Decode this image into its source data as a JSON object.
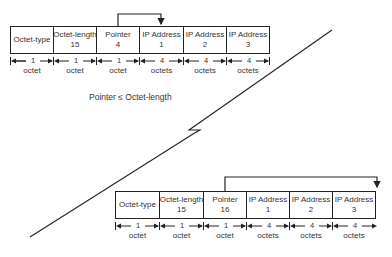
{
  "caption": "Pointer ≤ Octet-length",
  "top_record": {
    "fields": [
      {
        "name": "Octet-type",
        "value": "",
        "size": "1",
        "unit": "octet"
      },
      {
        "name": "Octet-length",
        "value": "15",
        "size": "1",
        "unit": "octet"
      },
      {
        "name": "Pointer",
        "value": "4",
        "size": "1",
        "unit": "octet"
      },
      {
        "name": "IP Address",
        "value": "1",
        "size": "4",
        "unit": "octets"
      },
      {
        "name": "IP Address",
        "value": "2",
        "size": "4",
        "unit": "octets"
      },
      {
        "name": "IP Address",
        "value": "3",
        "size": "4",
        "unit": "octets"
      }
    ],
    "pointer_target": "IP Address 1"
  },
  "bottom_record": {
    "fields": [
      {
        "name": "Octet-type",
        "value": "",
        "size": "1",
        "unit": "octet"
      },
      {
        "name": "Octet-length",
        "value": "15",
        "size": "1",
        "unit": "octet"
      },
      {
        "name": "Pointer",
        "value": "16",
        "size": "1",
        "unit": "octet"
      },
      {
        "name": "IP Address",
        "value": "1",
        "size": "4",
        "unit": "octets"
      },
      {
        "name": "IP Address",
        "value": "2",
        "size": "4",
        "unit": "octets"
      },
      {
        "name": "IP Address",
        "value": "3",
        "size": "4",
        "unit": "octets"
      }
    ],
    "pointer_target": "end of option"
  }
}
